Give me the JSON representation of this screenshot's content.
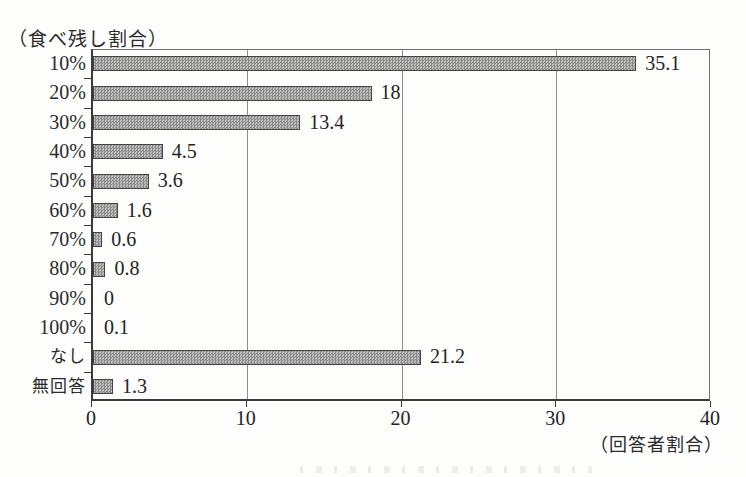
{
  "chart_data": {
    "type": "bar",
    "orientation": "horizontal",
    "y_axis_title": "（食べ残し割合）",
    "x_axis_title": "（回答者割合）",
    "categories": [
      "10%",
      "20%",
      "30%",
      "40%",
      "50%",
      "60%",
      "70%",
      "80%",
      "90%",
      "100%",
      "なし",
      "無回答"
    ],
    "values": [
      35.1,
      18,
      13.4,
      4.5,
      3.6,
      1.6,
      0.6,
      0.8,
      0,
      0.1,
      21.2,
      1.3
    ],
    "value_labels": [
      "35.1",
      "18",
      "13.4",
      "4.5",
      "3.6",
      "1.6",
      "0.6",
      "0.8",
      "0",
      "0.1",
      "21.2",
      "1.3"
    ],
    "xlim": [
      0,
      40
    ],
    "x_tick_labels": [
      "0",
      "10",
      "20",
      "30",
      "40"
    ],
    "x_tick_values": [
      0,
      10,
      20,
      30,
      40
    ],
    "gridline_values": [
      10,
      20,
      30
    ],
    "grid": "vertical-only",
    "legend": "none",
    "colors": {
      "bar_pattern_dark": "#8a8a8a",
      "bar_pattern_light": "#c2c2c2",
      "bar_border": "#454545",
      "axis_line": "#3a3a3a",
      "frame_line": "#6f6f6f",
      "gridline": "#8f8f8f",
      "text": "#242424",
      "background": "#fdfdfc"
    }
  }
}
